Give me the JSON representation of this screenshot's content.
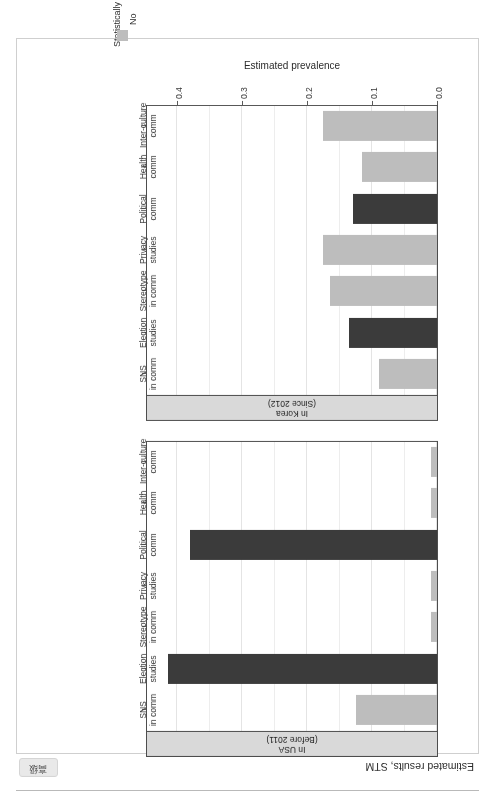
{
  "page": {
    "tag_label": "高级"
  },
  "figure": {
    "title": "Estimated results, STM"
  },
  "legend": {
    "title": "Statistically significant?",
    "entries": [
      {
        "label": "No",
        "color": "#bdbdbd"
      },
      {
        "label": "Yes",
        "color": "#3b3b3b"
      }
    ]
  },
  "chart_data": {
    "type": "bar",
    "title": "Estimated results, STM",
    "xlabel": "",
    "ylabel": "Estimated prevalence",
    "ylim": [
      0.0,
      0.45
    ],
    "yticks": [
      0.0,
      0.1,
      0.2,
      0.3,
      0.4
    ],
    "ytick_labels": [
      "0.0",
      "0.1",
      "0.2",
      "0.3",
      "0.4"
    ],
    "grid": true,
    "orientation": "vertical-bars-rotated-180",
    "legend_position": "bottom",
    "legend_title": "Statistically significant?",
    "categories": [
      "SNS\nin comm",
      "Election\nstudies",
      "Stereotype\nin comm",
      "Privacy\nstudies",
      "Political\ncomm",
      "Health\ncomm",
      "Inter-culture\ncomm"
    ],
    "category_labels_flat": [
      "SNS in comm",
      "Election studies",
      "Stereotype in comm",
      "Privacy studies",
      "Political comm",
      "Health comm",
      "Inter-culture comm"
    ],
    "panels": [
      {
        "name": "In USA\n(Before 2011)",
        "name_flat": "In USA (Before 2011)",
        "values": [
          0.125,
          0.415,
          0.01,
          0.01,
          0.38,
          0.01,
          0.01
        ],
        "significant": [
          "No",
          "Yes",
          "No",
          "No",
          "Yes",
          "No",
          "No"
        ]
      },
      {
        "name": "In Korea\n(Since 2012)",
        "name_flat": "In Korea (Since 2012)",
        "values": [
          0.09,
          0.135,
          0.165,
          0.175,
          0.13,
          0.115,
          0.175
        ],
        "significant": [
          "No",
          "Yes",
          "No",
          "No",
          "Yes",
          "No",
          "No"
        ]
      }
    ],
    "colors": {
      "No": "#bdbdbd",
      "Yes": "#3b3b3b"
    }
  }
}
